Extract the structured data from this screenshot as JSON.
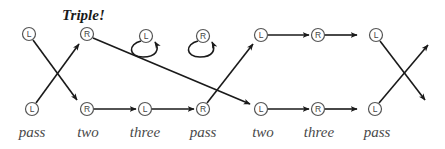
{
  "title": "Triple!",
  "colors": {
    "stroke": "#1a1a1a",
    "node_outline": "#555555",
    "label": "#4a4a4a"
  },
  "nodes_top": [
    {
      "id": "t0",
      "letter": "L",
      "x": 29,
      "y": 34
    },
    {
      "id": "t1",
      "letter": "R",
      "x": 87,
      "y": 34
    },
    {
      "id": "t2",
      "letter": "L",
      "x": 146,
      "y": 36,
      "self_loop": true
    },
    {
      "id": "t3",
      "letter": "R",
      "x": 203,
      "y": 36,
      "self_loop": true
    },
    {
      "id": "t4",
      "letter": "L",
      "x": 261,
      "y": 35
    },
    {
      "id": "t5",
      "letter": "R",
      "x": 318,
      "y": 35
    },
    {
      "id": "t6",
      "letter": "L",
      "x": 376,
      "y": 35
    }
  ],
  "nodes_bottom": [
    {
      "id": "b0",
      "letter": "L",
      "x": 32,
      "y": 109
    },
    {
      "id": "b1",
      "letter": "R",
      "x": 87,
      "y": 109
    },
    {
      "id": "b2",
      "letter": "L",
      "x": 145,
      "y": 109
    },
    {
      "id": "b3",
      "letter": "R",
      "x": 203,
      "y": 109
    },
    {
      "id": "b4",
      "letter": "L",
      "x": 261,
      "y": 109
    },
    {
      "id": "b5",
      "letter": "R",
      "x": 318,
      "y": 109
    },
    {
      "id": "b6",
      "letter": "L",
      "x": 375,
      "y": 109
    }
  ],
  "step_labels": [
    "pass",
    "two",
    "three",
    "pass",
    "two",
    "three",
    "pass"
  ],
  "edges": [
    {
      "from": "t0",
      "to": "b1",
      "desc": "cross down"
    },
    {
      "from": "b0",
      "to": "t1",
      "desc": "cross up"
    },
    {
      "from": "t1",
      "to": "b4",
      "desc": "long diagonal"
    },
    {
      "from": "b1",
      "to": "b2"
    },
    {
      "from": "b2",
      "to": "b3"
    },
    {
      "from": "b3",
      "to": "t4"
    },
    {
      "from": "t4",
      "to": "t5"
    },
    {
      "from": "t5",
      "to": "t6"
    },
    {
      "from": "b4",
      "to": "b5"
    },
    {
      "from": "b5",
      "to": "b6"
    },
    {
      "from": "t6",
      "to": "exit-bottom-right"
    },
    {
      "from": "b6",
      "to": "exit-top-right"
    }
  ]
}
